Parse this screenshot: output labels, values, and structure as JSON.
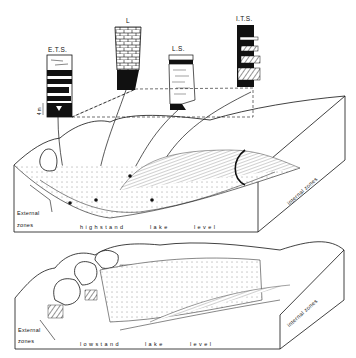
{
  "figure": {
    "columns": [
      {
        "id": "ets",
        "label": "E.T.S.",
        "scale_mark": "4 m"
      },
      {
        "id": "l",
        "label": "L"
      },
      {
        "id": "ls",
        "label": "L.S."
      },
      {
        "id": "its",
        "label": "I.T.S."
      }
    ],
    "upper_block": {
      "left_label_line1": "External",
      "left_label_line2": "zones",
      "bottom_word1": "highstand",
      "bottom_word2": "lake",
      "bottom_word3": "level",
      "right_label": "internal zones"
    },
    "lower_block": {
      "left_label_line1": "External",
      "left_label_line2": "zones",
      "bottom_word1": "lowstand",
      "bottom_word2": "lake",
      "bottom_word3": "level",
      "right_label": "internal zones"
    },
    "colors": {
      "ink": "#111111",
      "background": "#ffffff",
      "hatch": "#555555"
    }
  }
}
